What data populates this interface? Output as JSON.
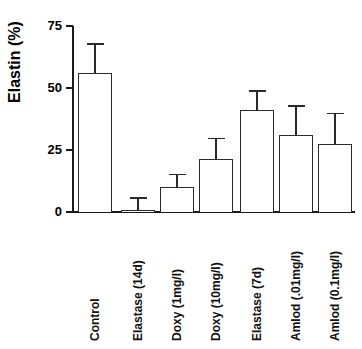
{
  "figure": {
    "background_color": "#ffffff",
    "bar_fill_color": "#ffffff",
    "bar_edge_color": "#2a2a2a",
    "axis_color": "#1a1a1a",
    "text_color": "#000000"
  },
  "axes": {
    "y_title": "Elastin (%)",
    "y_ticks": [
      "0",
      "25",
      "50",
      "75"
    ]
  },
  "chart_data": {
    "type": "bar",
    "title": "",
    "xlabel": "",
    "ylabel": "Elastin (%)",
    "ylim": [
      0,
      75
    ],
    "yticks": [
      0,
      25,
      50,
      75
    ],
    "grid": false,
    "legend": null,
    "error_bar_style": "upper-only-with-caps",
    "categories": [
      "Control",
      "Elastase (14d)",
      "Doxy (1mg/l)",
      "Doxy (10mg/l)",
      "Elastase (7d)",
      "Amlod (.01mg/l)",
      "Amlod (0.1mg/l)"
    ],
    "values": [
      56,
      1,
      10,
      21.5,
      41,
      31,
      27.5
    ],
    "errors": [
      12,
      5,
      5.5,
      8.5,
      8,
      12,
      12.5
    ],
    "error_tops": [
      68,
      6,
      15.5,
      30,
      49,
      43,
      40
    ]
  },
  "bars": [
    {
      "label": "Control",
      "value": 56,
      "error_top": 68
    },
    {
      "label": "Elastase (14d)",
      "value": 1,
      "error_top": 6
    },
    {
      "label": "Doxy (1mg/l)",
      "value": 10,
      "error_top": 15.5
    },
    {
      "label": "Doxy (10mg/l)",
      "value": 21.5,
      "error_top": 30
    },
    {
      "label": "Elastase (7d)",
      "value": 41,
      "error_top": 49
    },
    {
      "label": "Amlod (.01mg/l)",
      "value": 31,
      "error_top": 43
    },
    {
      "label": "Amlod (0.1mg/l)",
      "value": 27.5,
      "error_top": 40
    }
  ]
}
